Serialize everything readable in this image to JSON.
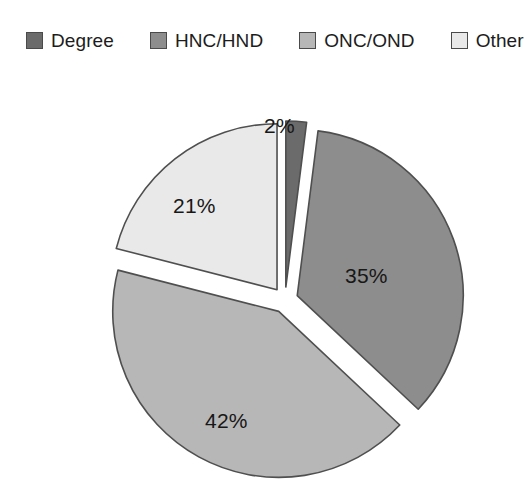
{
  "legend": {
    "items": [
      {
        "label": "Degree",
        "color": "#6b6b6b"
      },
      {
        "label": "HNC/HND",
        "color": "#8d8d8d"
      },
      {
        "label": "ONC/OND",
        "color": "#b7b7b7"
      },
      {
        "label": "Other",
        "color": "#e9e9e9"
      }
    ]
  },
  "chart_data": {
    "type": "pie",
    "title": "",
    "subtitle": "",
    "xlabel": "",
    "ylabel": "",
    "categories": [
      "Degree",
      "HNC/HND",
      "ONC/OND",
      "Other"
    ],
    "values": [
      2,
      35,
      42,
      21
    ],
    "value_labels": [
      "2%",
      "21%",
      "35%",
      "42%"
    ],
    "slices": [
      {
        "name": "Degree",
        "value": 2,
        "label": "2%",
        "color": "#6b6b6b"
      },
      {
        "name": "HNC/HND",
        "value": 35,
        "label": "35%",
        "color": "#8d8d8d"
      },
      {
        "name": "ONC/OND",
        "value": 42,
        "label": "42%",
        "color": "#b7b7b7"
      },
      {
        "name": "Other",
        "value": 21,
        "label": "21%",
        "color": "#e9e9e9"
      }
    ],
    "units": "percent",
    "total": 100,
    "exploded": true,
    "start_angle_deg": 0,
    "direction": "clockwise",
    "legend_position": "top",
    "grid": false,
    "stroke_color": "#4f4f4f",
    "background": "#ffffff"
  }
}
